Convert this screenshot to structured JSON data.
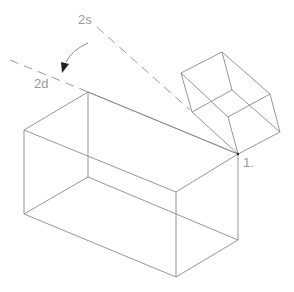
{
  "diagram": {
    "labels": {
      "axis_start": "2s",
      "axis_end": "2d",
      "corner_point": "1."
    },
    "colors": {
      "line": "#8a8a8a",
      "label": "#9a9a9a",
      "arrowhead": "#222222",
      "background": "#ffffff"
    },
    "large_box": {
      "vertices": {
        "top_back_left": [
          88,
          92
        ],
        "top_left": [
          24,
          130
        ],
        "top_front": [
          176,
          192
        ],
        "top_right": [
          238,
          154
        ],
        "bottom_back_left": [
          88,
          177
        ],
        "bottom_left": [
          24,
          214
        ],
        "bottom_front": [
          176,
          277
        ],
        "bottom_right": [
          238,
          240
        ]
      }
    },
    "small_cube": {
      "vertices": [
        [
          222,
          52
        ],
        [
          181,
          73
        ],
        [
          192,
          112
        ],
        [
          232,
          90
        ],
        [
          270,
          94
        ],
        [
          280,
          132
        ],
        [
          238,
          154
        ],
        [
          228,
          117
        ]
      ]
    },
    "dashed_axes": [
      {
        "name": "2s",
        "from": [
          95,
          25
        ],
        "to": [
          190,
          110
        ]
      },
      {
        "name": "2d",
        "from": [
          10,
          60
        ],
        "to": [
          88,
          92
        ]
      }
    ]
  }
}
